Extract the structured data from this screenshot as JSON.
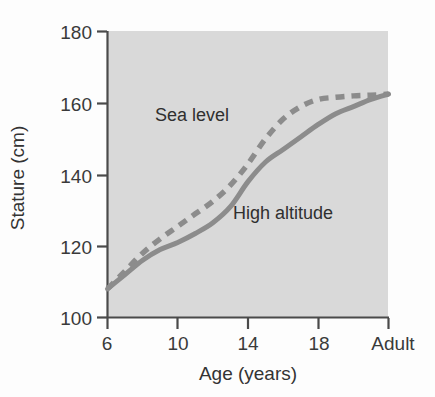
{
  "chart_data": {
    "type": "line",
    "title": "",
    "xlabel": "Age (years)",
    "ylabel": "Stature (cm)",
    "xlim": [
      6,
      22
    ],
    "ylim": [
      100,
      180
    ],
    "grid": false,
    "legend_position": "inline-annotations",
    "x_tick_labels": [
      "6",
      "10",
      "14",
      "18",
      "Adult"
    ],
    "x_tick_values": [
      6,
      10,
      14,
      18,
      22
    ],
    "y_tick_labels": [
      "100",
      "120",
      "140",
      "160",
      "180"
    ],
    "y_tick_values": [
      100,
      120,
      140,
      160,
      180
    ],
    "plot_background": "#d9d9d9",
    "line_color": "#8c8c8c",
    "axis_color": "#4a4a4a",
    "series": [
      {
        "name": "Sea level",
        "style": "dashed",
        "label_text": "Sea level",
        "x": [
          6,
          7,
          8,
          9,
          10,
          11,
          12,
          13,
          14,
          15,
          16,
          17,
          18,
          19,
          20,
          21,
          22
        ],
        "values": [
          108,
          113,
          118,
          122,
          125.5,
          129,
          132.5,
          137,
          143,
          150,
          155.5,
          159,
          161,
          161.6,
          162,
          162.2,
          162.5
        ]
      },
      {
        "name": "High altitude",
        "style": "solid",
        "label_text": "High altitude",
        "x": [
          6,
          7,
          8,
          9,
          10,
          11,
          12,
          13,
          14,
          15,
          16,
          17,
          18,
          19,
          20,
          21,
          22
        ],
        "values": [
          108,
          112,
          116,
          119,
          121,
          123.5,
          126.5,
          131,
          138,
          143.5,
          147,
          150.5,
          154,
          157,
          159,
          161,
          162.5
        ]
      }
    ],
    "annotations": [
      {
        "text": "Sea level",
        "x_px": 155,
        "y_px": 121
      },
      {
        "text": "High altitude",
        "x_px": 233,
        "y_px": 219
      }
    ]
  }
}
